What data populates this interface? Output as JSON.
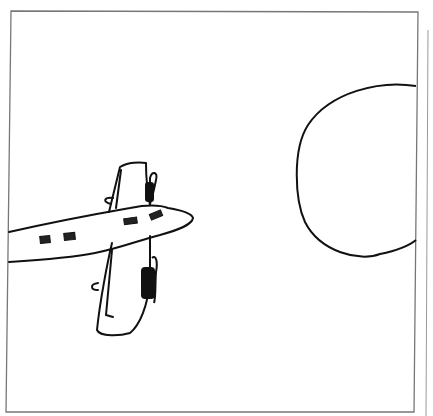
{
  "image": {
    "description": "Hand-drawn line sketch of a twin-propeller airplane flying toward a large circle (sun) inside a rectangular frame",
    "colors": {
      "background": "#ffffff",
      "ink": "#111111",
      "frame": "#777777"
    }
  },
  "scene": {
    "objects": [
      "airplane",
      "sun",
      "frame"
    ]
  }
}
